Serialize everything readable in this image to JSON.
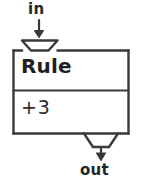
{
  "diagram": {
    "type": "function-machine",
    "title_visible": false,
    "input": {
      "label": "in",
      "arrow": "down-arrow-icon",
      "port_shape": "trapezoid-notch-down"
    },
    "machine": {
      "header_label": "Rule",
      "body_label": "+3",
      "operation": "+3"
    },
    "output": {
      "label": "out",
      "arrow": "down-arrow-icon",
      "port_shape": "trapezoid-tab-down"
    },
    "colors": {
      "stroke": "#3a3a3a",
      "text": "#262626",
      "background": "#ffffff"
    }
  }
}
